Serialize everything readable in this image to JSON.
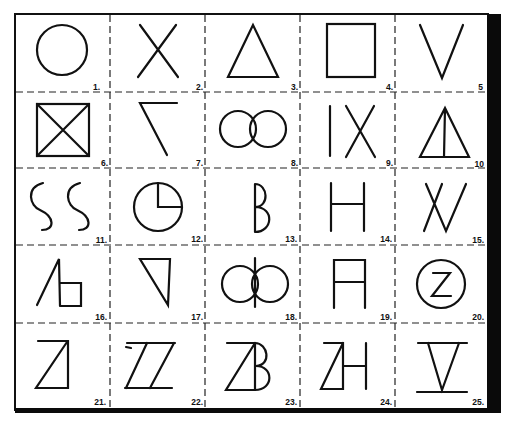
{
  "colors": {
    "ink": "#111111",
    "paper": "#ffffff"
  },
  "grid": {
    "rows": 5,
    "cols": 5
  },
  "cells": [
    {
      "number": "1.",
      "figure": "circle"
    },
    {
      "number": "2.",
      "figure": "x-cross"
    },
    {
      "number": "3.",
      "figure": "triangle"
    },
    {
      "number": "4.",
      "figure": "square"
    },
    {
      "number": "5",
      "figure": "v-shape"
    },
    {
      "number": "6.",
      "figure": "square-with-diagonals"
    },
    {
      "number": "7.",
      "figure": "angled-seven"
    },
    {
      "number": "8.",
      "figure": "two-overlapping-circles"
    },
    {
      "number": "9.",
      "figure": "bar-and-x"
    },
    {
      "number": "10",
      "figure": "triangle-with-median"
    },
    {
      "number": "11.",
      "figure": "double-s-curves"
    },
    {
      "number": "12.",
      "figure": "circle-with-quadrant"
    },
    {
      "number": "13.",
      "figure": "half-b"
    },
    {
      "number": "14.",
      "figure": "h-letter"
    },
    {
      "number": "15.",
      "figure": "n-zigzag"
    },
    {
      "number": "16.",
      "figure": "slash-with-box"
    },
    {
      "number": "17.",
      "figure": "inverted-right-triangle"
    },
    {
      "number": "18.",
      "figure": "circles-with-lens-and-bar"
    },
    {
      "number": "19.",
      "figure": "a-box"
    },
    {
      "number": "20.",
      "figure": "z-in-circle"
    },
    {
      "number": "21.",
      "figure": "z-triangle"
    },
    {
      "number": "22.",
      "figure": "double-z-parallelogram"
    },
    {
      "number": "23.",
      "figure": "z-b-combined"
    },
    {
      "number": "24.",
      "figure": "z-h-combined"
    },
    {
      "number": "25.",
      "figure": "inverted-triangle-between-bars"
    }
  ]
}
